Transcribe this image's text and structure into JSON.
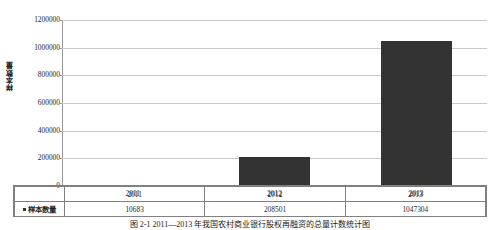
{
  "chart_data": {
    "type": "bar",
    "title": "",
    "xlabel": "",
    "ylabel": "样本数量",
    "categories": [
      "2011",
      "2012",
      "2013"
    ],
    "series": [
      {
        "name": "样本数量",
        "values": [
          10683,
          208501,
          1047304
        ],
        "color": "#333333"
      }
    ],
    "ylim": [
      0,
      1200000
    ],
    "y_ticks": [
      {
        "value": 1200000,
        "label": "1200000"
      },
      {
        "value": 1000000,
        "label": "1000000"
      },
      {
        "value": 800000,
        "label": "800000"
      },
      {
        "value": 600000,
        "label": "600000"
      },
      {
        "value": 400000,
        "label": "400000"
      },
      {
        "value": 200000,
        "label": "200000"
      },
      {
        "value": 0,
        "label": "0"
      }
    ],
    "grid": true,
    "legend": {
      "position": "data-table-row-header",
      "entries": [
        "样本数量"
      ]
    },
    "data_table": {
      "row_header": "样本数量",
      "columns": [
        "2011",
        "2012",
        "2013"
      ],
      "values": [
        "10683",
        "208501",
        "1047304"
      ]
    }
  },
  "caption": {
    "text": "图 2-1 2011—2013 年我国农村商业银行股权再融资的总量计数统计图"
  }
}
